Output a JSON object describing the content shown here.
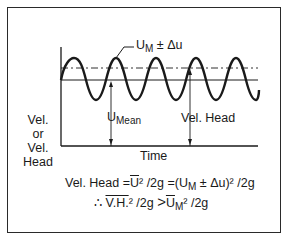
{
  "diagram": {
    "y_axis_label": [
      "Vel.",
      "or",
      "Vel.",
      "Head"
    ],
    "x_axis_label": "Time",
    "annotations": {
      "peak_label_main": "U",
      "peak_label_sub": "M",
      "peak_label_rest": " ± Δu",
      "mean_label_main": "U",
      "mean_label_sub": "Mean",
      "vel_head_label": "Vel. Head"
    },
    "equations": {
      "line1_a": "Vel. Head =",
      "line1_ubar": "U",
      "line1_b": "² /2g =(U",
      "line1_sub": "M",
      "line1_c": " ± Δu)² /2g",
      "line2_therefore": "∴ ",
      "line2_vh": "V.H.",
      "line2_b": "² /2g ",
      "line2_gt": ">",
      "line2_ubar": "U",
      "line2_sub": "M",
      "line2_c": "² /2g"
    },
    "colors": {
      "line": "#1a1a1a",
      "frame": "#2a2a2a"
    }
  }
}
